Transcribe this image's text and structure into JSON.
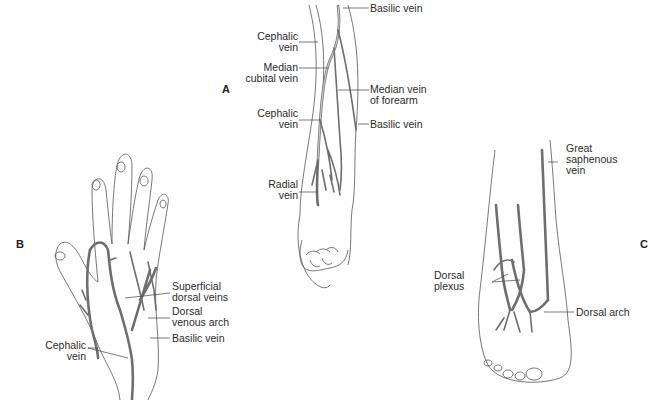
{
  "figure": {
    "panels": [
      {
        "id": "A",
        "letter": "A",
        "region": "forearm",
        "labels": {
          "cephalic_upper": [
            "Cephalic",
            "vein"
          ],
          "basilic_upper": "Basilic vein",
          "median_cubital": [
            "Median",
            "cubital vein"
          ],
          "median_forearm": [
            "Median vein",
            "of forearm"
          ],
          "cephalic_lower": [
            "Cephalic",
            "vein"
          ],
          "basilic_lower": "Basilic vein",
          "radial": [
            "Radial",
            "vein"
          ]
        }
      },
      {
        "id": "B",
        "letter": "B",
        "region": "hand",
        "labels": {
          "superficial_dorsal": [
            "Superficial",
            "dorsal veins"
          ],
          "dorsal_venous_arch": [
            "Dorsal",
            "venous arch"
          ],
          "basilic": "Basilic vein",
          "cephalic": [
            "Cephalic",
            "vein"
          ]
        }
      },
      {
        "id": "C",
        "letter": "C",
        "region": "foot",
        "labels": {
          "great_saphenous": [
            "Great",
            "saphenous",
            "vein"
          ],
          "dorsal_plexus": [
            "Dorsal",
            "plexus"
          ],
          "dorsal_arch": "Dorsal arch"
        }
      }
    ]
  }
}
